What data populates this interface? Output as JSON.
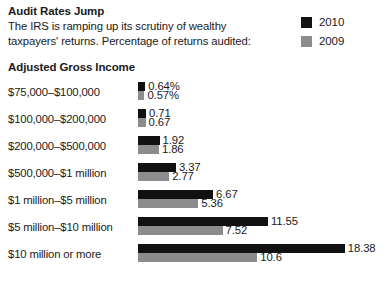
{
  "header": {
    "title": "Audit Rates Jump",
    "subtitle_line1": "The IRS is ramping up its scrutiny of wealthy",
    "subtitle_line2": "taxpayers' returns. Percentage of returns audited:"
  },
  "legend": {
    "items": [
      {
        "label": "2010",
        "color": "#111111"
      },
      {
        "label": "2009",
        "color": "#8c8c8c"
      }
    ]
  },
  "axis": {
    "group_title": "Adjusted Gross Income"
  },
  "colors": {
    "series_2010": "#111111",
    "series_2009": "#8c8c8c",
    "background": "#ffffff",
    "text": "#1a1a1a"
  },
  "chart_data": {
    "type": "bar",
    "orientation": "horizontal",
    "title": "Audit Rates Jump",
    "subtitle": "The IRS is ramping up its scrutiny of wealthy taxpayers' returns. Percentage of returns audited:",
    "xlabel": "",
    "ylabel": "Adjusted Gross Income",
    "grid": false,
    "legend_position": "top-right",
    "xlim": [
      0,
      18.38
    ],
    "categories": [
      "$75,000–$100,000",
      "$100,000–$200,000",
      "$200,000–$500,000",
      "$500,000–$1 million",
      "$1 million–$5 million",
      "$5 million–$10 million",
      "$10 million or more"
    ],
    "series": [
      {
        "name": "2010",
        "color": "#111111",
        "values": [
          0.64,
          0.71,
          1.92,
          3.37,
          6.67,
          11.55,
          18.38
        ],
        "labels": [
          "0.64%",
          "0.71",
          "1.92",
          "3.37",
          "6.67",
          "11.55",
          "18.38"
        ]
      },
      {
        "name": "2009",
        "color": "#8c8c8c",
        "values": [
          0.57,
          0.67,
          1.86,
          2.77,
          5.36,
          7.52,
          10.6
        ],
        "labels": [
          "0.57%",
          "0.67",
          "1.86",
          "2.77",
          "5.36",
          "7.52",
          "10.6"
        ]
      }
    ]
  }
}
